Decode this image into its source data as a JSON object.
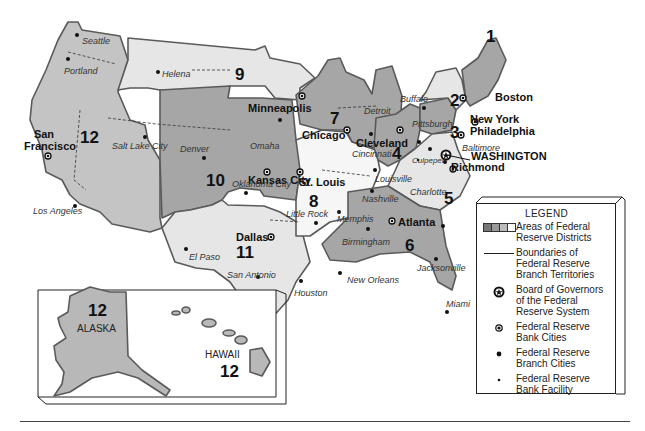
{
  "map": {
    "title": "Federal Reserve Districts",
    "districts": [
      {
        "number": "1",
        "bank_city": "Boston"
      },
      {
        "number": "2",
        "bank_city": "New York"
      },
      {
        "number": "3",
        "bank_city": "Philadelphia"
      },
      {
        "number": "4",
        "bank_city": "Cleveland"
      },
      {
        "number": "5",
        "bank_city": "Richmond"
      },
      {
        "number": "6",
        "bank_city": "Atlanta"
      },
      {
        "number": "7",
        "bank_city": "Chicago"
      },
      {
        "number": "8",
        "bank_city": "St. Louis"
      },
      {
        "number": "9",
        "bank_city": "Minneapolis"
      },
      {
        "number": "10",
        "bank_city": "Kansas City"
      },
      {
        "number": "11",
        "bank_city": "Dallas"
      },
      {
        "number": "12",
        "bank_city": "San Francisco"
      }
    ],
    "board_of_governors": "WASHINGTON",
    "branch_cities": [
      "Seattle",
      "Portland",
      "Helena",
      "Salt Lake City",
      "Denver",
      "Omaha",
      "Los Angeles",
      "Oklahoma City",
      "Little Rock",
      "El Paso",
      "San Antonio",
      "Houston",
      "Memphis",
      "Louisville",
      "Nashville",
      "Birmingham",
      "New Orleans",
      "Jacksonville",
      "Miami",
      "Detroit",
      "Buffalo",
      "Pittsburgh",
      "Cincinnati",
      "Baltimore",
      "Charlotte",
      "Culpeper"
    ],
    "inset": {
      "alaska_label": "ALASKA",
      "alaska_district": "12",
      "hawaii_label": "HAWAII",
      "hawaii_district": "12"
    },
    "colors": {
      "district_dark": "#a6a6a6",
      "district_mid": "#c4c4c4",
      "district_light": "#e6e6e6",
      "district_white": "#f6f6f6",
      "boundary": "#5a5a5a"
    }
  },
  "legend": {
    "title": "LEGEND",
    "items": [
      {
        "symbol": "swatch-bar-icon",
        "text": "Areas of Federal Reserve Districts"
      },
      {
        "symbol": "solid-line-icon",
        "text": "Boundaries of Federal Reserve Branch Territories"
      },
      {
        "symbol": "star-circle-icon",
        "text": "Board of Governors of the Federal Reserve System"
      },
      {
        "symbol": "bullseye-dot-icon",
        "text": "Federal Reserve Bank Cities"
      },
      {
        "symbol": "large-dot-icon",
        "text": "Federal Reserve Branch Cities"
      },
      {
        "symbol": "small-dot-icon",
        "text": "Federal Reserve Bank Facility"
      }
    ]
  }
}
